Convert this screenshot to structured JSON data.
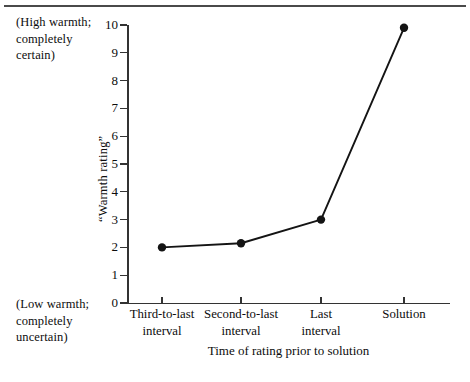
{
  "chart_data": {
    "type": "line",
    "title": "",
    "subtitle": "",
    "xlabel": "Time of rating prior to solution",
    "ylabel": "“Warmth rating”",
    "categories": [
      "Third-to-last\ninterval",
      "Second-to-last\ninterval",
      "Last\ninterval",
      "Solution"
    ],
    "values": [
      2.0,
      2.15,
      3.0,
      9.9
    ],
    "series": [
      {
        "name": "“Warmth rating”",
        "values": [
          2.0,
          2.15,
          3.0,
          9.9
        ]
      }
    ],
    "ylim": [
      0,
      10
    ],
    "ytick_labels": [
      "0",
      "1",
      "2",
      "3",
      "4",
      "5",
      "6",
      "7",
      "8",
      "9",
      "10"
    ],
    "ytick_values": [
      0,
      1,
      2,
      3,
      4,
      5,
      6,
      7,
      8,
      9,
      10
    ],
    "grid": false,
    "legend": false,
    "legend_position": "none",
    "marker": "filled-circle",
    "line_color": "#141414",
    "marker_color": "#141414",
    "axis_color": "#333333",
    "background_color": "#ffffff",
    "annotations": [
      {
        "name": "high-anchor",
        "text": "(High warmth;\ncompletely\ncertain)",
        "position": "top-left-of-y-axis",
        "anchor_value": 10
      },
      {
        "name": "low-anchor",
        "text": "(Low warmth;\ncompletely\nuncertain)",
        "position": "bottom-left-of-y-axis",
        "anchor_value": 0
      }
    ]
  },
  "figure": {
    "top_rule_color": "#4a4a4a"
  }
}
